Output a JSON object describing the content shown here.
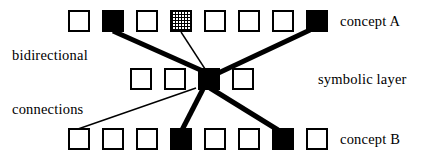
{
  "figure": {
    "width": 431,
    "height": 158,
    "background_color": "#ffffff",
    "ink_color": "#000000"
  },
  "labels": {
    "concept_a": "concept A",
    "symbolic_layer": "symbolic layer",
    "concept_b": "concept B",
    "bidirectional": "bidirectional",
    "connections": "connections"
  },
  "layers": [
    {
      "id": "concept-a",
      "label": "concept A",
      "row": "top",
      "y": 10,
      "node_count": 8,
      "node_size": 22,
      "node_spacing": 34,
      "start_x": 68,
      "nodes": [
        {
          "index": 1,
          "x": 68,
          "state": "empty"
        },
        {
          "index": 2,
          "x": 102,
          "state": "filled"
        },
        {
          "index": 3,
          "x": 136,
          "state": "empty"
        },
        {
          "index": 4,
          "x": 170,
          "state": "hatched"
        },
        {
          "index": 5,
          "x": 204,
          "state": "empty"
        },
        {
          "index": 6,
          "x": 238,
          "state": "empty"
        },
        {
          "index": 7,
          "x": 272,
          "state": "empty"
        },
        {
          "index": 8,
          "x": 306,
          "state": "filled"
        }
      ]
    },
    {
      "id": "symbolic",
      "label": "symbolic layer",
      "row": "middle",
      "y": 68,
      "node_count": 4,
      "node_size": 22,
      "node_spacing": 34,
      "start_x": 130,
      "nodes": [
        {
          "index": 1,
          "x": 130,
          "state": "empty"
        },
        {
          "index": 2,
          "x": 164,
          "state": "empty"
        },
        {
          "index": 3,
          "x": 198,
          "state": "filled"
        },
        {
          "index": 4,
          "x": 232,
          "state": "empty"
        }
      ]
    },
    {
      "id": "concept-b",
      "label": "concept B",
      "row": "bottom",
      "y": 128,
      "node_count": 8,
      "node_size": 22,
      "node_spacing": 34,
      "start_x": 68,
      "nodes": [
        {
          "index": 1,
          "x": 68,
          "state": "empty"
        },
        {
          "index": 2,
          "x": 102,
          "state": "empty"
        },
        {
          "index": 3,
          "x": 136,
          "state": "empty"
        },
        {
          "index": 4,
          "x": 170,
          "state": "filled"
        },
        {
          "index": 5,
          "x": 204,
          "state": "empty"
        },
        {
          "index": 6,
          "x": 238,
          "state": "empty"
        },
        {
          "index": 7,
          "x": 272,
          "state": "filled"
        },
        {
          "index": 8,
          "x": 306,
          "state": "empty"
        }
      ]
    }
  ],
  "edges": [
    {
      "id": "edge-a2-hub",
      "from": "concept-a.2",
      "to": "symbolic.3",
      "x1": 113,
      "y1": 31,
      "x2": 205,
      "y2": 72,
      "weight": "thick",
      "width": 5
    },
    {
      "id": "edge-a4-hub",
      "from": "concept-a.4",
      "to": "symbolic.3",
      "x1": 181,
      "y1": 32,
      "x2": 207,
      "y2": 72,
      "weight": "thin",
      "width": 1.4
    },
    {
      "id": "edge-a8-hub",
      "from": "concept-a.8",
      "to": "symbolic.3",
      "x1": 310,
      "y1": 30,
      "x2": 212,
      "y2": 76,
      "weight": "thick",
      "width": 5
    },
    {
      "id": "edge-hub-b1",
      "from": "symbolic.3",
      "to": "concept-b.1",
      "x1": 196,
      "y1": 88,
      "x2": 78,
      "y2": 129,
      "weight": "thin",
      "width": 1.4
    },
    {
      "id": "edge-hub-b4",
      "from": "symbolic.3",
      "to": "concept-b.4",
      "x1": 203,
      "y1": 89,
      "x2": 182,
      "y2": 130,
      "weight": "thick",
      "width": 5
    },
    {
      "id": "edge-hub-b7",
      "from": "symbolic.3",
      "to": "concept-b.7",
      "x1": 210,
      "y1": 88,
      "x2": 278,
      "y2": 130,
      "weight": "thick",
      "width": 5
    }
  ],
  "annotations": [
    {
      "id": "row-label-concept-a",
      "text": "concept A",
      "x": 340,
      "y": 14
    },
    {
      "id": "row-label-symbolic",
      "text": "symbolic layer",
      "x": 318,
      "y": 72
    },
    {
      "id": "row-label-concept-b",
      "text": "concept B",
      "x": 340,
      "y": 132
    },
    {
      "id": "side-label-bidirectional",
      "text": "bidirectional",
      "x": 12,
      "y": 48
    },
    {
      "id": "side-label-connections",
      "text": "connections",
      "x": 12,
      "y": 102
    }
  ]
}
